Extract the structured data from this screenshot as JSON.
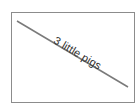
{
  "diagram": {
    "label": "3 little pigs",
    "colors": {
      "frame": "#8c8c8c",
      "line": "#7a7a7a",
      "text": "#333333"
    }
  }
}
